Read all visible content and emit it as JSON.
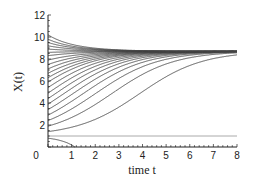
{
  "chart_data": {
    "type": "line",
    "title": "",
    "xlabel": "time t",
    "ylabel": "X(t)",
    "xlim": [
      0,
      8
    ],
    "ylim": [
      0,
      12
    ],
    "xticks": [
      1,
      2,
      3,
      4,
      5,
      6,
      7,
      8
    ],
    "yticks": [
      0,
      2,
      4,
      6,
      8,
      10,
      12
    ],
    "grid": false,
    "legend": null,
    "model": "logistic growth with threshold: dX/dt = r(X-a)(K-X)/K",
    "params": {
      "carrying_capacity": 8.7,
      "threshold": 1.0,
      "rate": 0.85
    },
    "threshold_line": {
      "y": 1.0,
      "color": "#aaaaaa"
    },
    "initial_values": [
      0.8,
      1.4,
      1.9,
      2.4,
      2.9,
      3.4,
      3.9,
      4.4,
      4.9,
      5.4,
      5.9,
      6.3,
      6.7,
      7.1,
      7.5,
      7.9,
      8.3,
      8.6,
      8.9,
      9.2,
      9.5,
      9.8,
      10.2
    ],
    "series_color": "#444444"
  }
}
